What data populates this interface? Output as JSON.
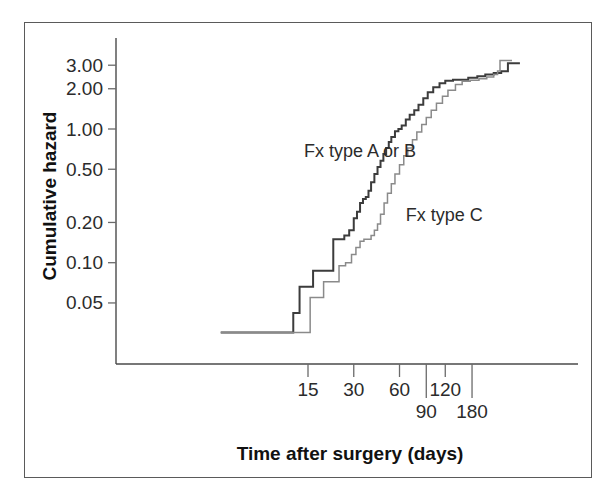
{
  "figure": {
    "background": "#ffffff",
    "frame_color": "#5a5a5a"
  },
  "chart_data": {
    "type": "line",
    "title": "",
    "xlabel": "Time after surgery (days)",
    "ylabel": "Cumulative hazard",
    "xscale": "log",
    "yscale": "log",
    "xlim": [
      4,
      320
    ],
    "ylim": [
      0.03,
      3.6
    ],
    "grid": false,
    "legend_position": "inline-annotations",
    "xticks": [
      15,
      30,
      60,
      90,
      120,
      180
    ],
    "xtick_labels": [
      "15",
      "30",
      "60",
      "90",
      "120",
      "180"
    ],
    "xtick_label_rows": [
      0,
      0,
      0,
      1,
      0,
      1
    ],
    "yticks": [
      0.05,
      0.1,
      0.2,
      0.5,
      1.0,
      2.0,
      3.0
    ],
    "ytick_labels": [
      "0.05",
      "0.10",
      "0.20",
      "0.50",
      "1.00",
      "2.00",
      "3.00"
    ],
    "series": [
      {
        "name": "Fx type A or B",
        "color": "#3c3c3c",
        "width": 2.0,
        "label_x": 33,
        "label_y": 0.62,
        "step": "post",
        "x": [
          4.0,
          12.0,
          12.0,
          13.2,
          14.6,
          16.2,
          18.0,
          20.0,
          22.0,
          24.0,
          26.0,
          28.0,
          30.0,
          31.5,
          33.0,
          34.5,
          36.0,
          37.5,
          39.0,
          41.0,
          43.0,
          45.0,
          47.0,
          49.0,
          51.0,
          53.0,
          56.0,
          59.0,
          62.0,
          66.0,
          70.0,
          75.0,
          80.0,
          86.0,
          92.0,
          100.0,
          110.0,
          120.0,
          135.0,
          150.0,
          170.0,
          195.0,
          220.0,
          250.0,
          280.0,
          310.0
        ],
        "y": [
          0.03,
          0.03,
          0.042,
          0.066,
          0.066,
          0.087,
          0.087,
          0.087,
          0.15,
          0.15,
          0.16,
          0.175,
          0.215,
          0.24,
          0.28,
          0.3,
          0.31,
          0.345,
          0.4,
          0.46,
          0.52,
          0.58,
          0.65,
          0.72,
          0.8,
          0.87,
          0.96,
          1.0,
          1.06,
          1.18,
          1.28,
          1.38,
          1.52,
          1.7,
          1.88,
          2.05,
          2.2,
          2.3,
          2.34,
          2.34,
          2.42,
          2.48,
          2.56,
          2.62,
          2.7,
          3.1
        ]
      },
      {
        "name": "Fx type C",
        "color": "#8a8a8a",
        "width": 1.5,
        "label_x": 118,
        "label_y": 0.205,
        "step": "post",
        "x": [
          4.0,
          15.5,
          15.5,
          17.0,
          19.0,
          21.5,
          24.0,
          26.5,
          29.0,
          31.0,
          33.0,
          35.0,
          37.0,
          39.0,
          41.0,
          43.0,
          45.0,
          47.5,
          50.0,
          53.0,
          56.0,
          60.0,
          64.0,
          68.0,
          73.0,
          78.0,
          84.0,
          90.0,
          97.0,
          105.0,
          115.0,
          125.0,
          140.0,
          155.0,
          175.0,
          200.0,
          225.0,
          250.0,
          265.0,
          275.0
        ],
        "y": [
          0.03,
          0.03,
          0.055,
          0.055,
          0.072,
          0.072,
          0.095,
          0.1,
          0.115,
          0.13,
          0.145,
          0.15,
          0.15,
          0.16,
          0.175,
          0.195,
          0.23,
          0.28,
          0.33,
          0.39,
          0.46,
          0.54,
          0.63,
          0.72,
          0.83,
          0.95,
          1.08,
          1.22,
          1.38,
          1.56,
          1.76,
          1.95,
          2.15,
          2.28,
          2.32,
          2.38,
          2.45,
          2.56,
          2.72,
          3.25
        ]
      }
    ]
  }
}
